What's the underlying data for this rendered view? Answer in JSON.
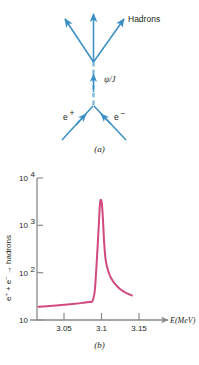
{
  "figure": {
    "panel_a": {
      "caption": "(a)",
      "title": "electron-positron annihilation to J/psi resonance",
      "labels": {
        "hadrons": "Hadrons",
        "propagator": "ψ/J",
        "positron": "e",
        "positron_charge": "+",
        "electron": "e",
        "electron_charge": "−"
      },
      "colors": {
        "line": "#3a8fc4",
        "line_light": "#74b5da"
      }
    },
    "panel_b": {
      "caption": "(b)",
      "colors": {
        "curve": "#d1497f",
        "axis": "#8a8a8a"
      }
    }
  },
  "chart_data": {
    "type": "line",
    "title": "",
    "xlabel": "E(MeV)",
    "ylabel": "e+ + e- → hadrons",
    "ylabel_parts": {
      "e1": "e",
      "sup1": "+",
      "plus": " + ",
      "e2": "e",
      "sup2": "−",
      "arrow": " → ",
      "tail": "hadrons"
    },
    "xscale": "linear",
    "yscale": "log",
    "xlim": [
      3.02,
      3.175
    ],
    "ylim": [
      10,
      10000
    ],
    "grid": false,
    "legend": null,
    "xticks": [
      3.05,
      3.1,
      3.15
    ],
    "xticklabels": [
      "3.05",
      "3.1",
      "3.15"
    ],
    "yticks": [
      10,
      100,
      1000,
      10000
    ],
    "yticklabels": [
      "10",
      "10²",
      "10³",
      "10⁴"
    ],
    "ytick_parts": [
      {
        "base": "10",
        "exp": ""
      },
      {
        "base": "10",
        "exp": "2"
      },
      {
        "base": "10",
        "exp": "3"
      },
      {
        "base": "10",
        "exp": "4"
      }
    ],
    "series": [
      {
        "name": "e+ e- → hadrons cross section",
        "color": "#d1497f",
        "x": [
          3.022,
          3.04,
          3.055,
          3.068,
          3.078,
          3.086,
          3.09,
          3.093,
          3.0955,
          3.098,
          3.0995,
          3.1005,
          3.102,
          3.1035,
          3.105,
          3.107,
          3.11,
          3.114,
          3.119,
          3.125,
          3.132,
          3.14
        ],
        "y": [
          19,
          20,
          21,
          22,
          23,
          24,
          25,
          40,
          160,
          900,
          2600,
          3450,
          2900,
          1300,
          420,
          180,
          110,
          75,
          57,
          45,
          38,
          33
        ]
      }
    ],
    "annotations": [
      {
        "text": "resonance peak at approximately 3.1 MeV",
        "x": 3.1005,
        "y": 3450
      }
    ]
  }
}
